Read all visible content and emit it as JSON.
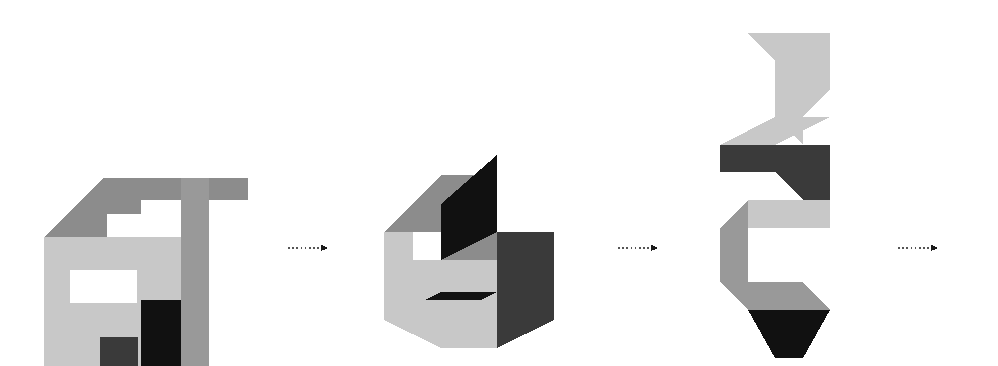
{
  "page": {
    "title": "Voxel Shape Rotation Sequence",
    "background_color": "#ffffff",
    "width": 998,
    "height": 366,
    "figure_count": 3,
    "arrow_count": 3
  },
  "palette": {
    "front_face": "#c8c8c8",
    "top_face": "#8c8c8c",
    "side_face": "#999999",
    "dark_face": "#3a3a3a",
    "shadow_face": "#111111",
    "white_cutout": "#ffffff",
    "arrow_color": "#555555",
    "outline": "#ffffff"
  },
  "figures": [
    {
      "id": "figure-1",
      "label": "Shape A",
      "index": 1,
      "description": "Isometric block cluster with rectangular notch on the front face and a stepped top",
      "bbox": {
        "x": 40,
        "y": 168,
        "width": 266,
        "height": 198
      },
      "faces": [
        {
          "name": "top-left-slab",
          "tone": "top",
          "points": "44,237 103,178 181,178 181,200 141,200 141,214 107,214 107,237"
        },
        {
          "name": "top-right-wing",
          "tone": "top",
          "points": "190,178 248,178 248,200 209,200 209,178"
        },
        {
          "name": "front-main",
          "tone": "front",
          "points": "44,237 181,237 181,366 44,366"
        },
        {
          "name": "front-notch",
          "tone": "cutout",
          "points": "70,270 137,270 137,303 70,303"
        },
        {
          "name": "front-dark-tab",
          "tone": "dark",
          "points": "100,337 138,337 138,366 100,366"
        },
        {
          "name": "shadow-wedge",
          "tone": "shadow",
          "points": "141,300 181,300 181,366 141,366"
        },
        {
          "name": "right-column",
          "tone": "side",
          "points": "181,178 209,178 209,366 181,366"
        },
        {
          "name": "right-pillar",
          "tone": "side",
          "points": "181,200 209,200 209,300 181,300"
        }
      ]
    },
    {
      "id": "figure-2",
      "label": "Shape B",
      "index": 2,
      "description": "Isometric S-shaped block cluster viewed from above-left with dark inner faces",
      "bbox": {
        "x": 384,
        "y": 155,
        "width": 186,
        "height": 200
      },
      "faces": [
        {
          "name": "upper-top",
          "tone": "top",
          "points": "384,232 441,175 497,175 497,204 441,204 441,232"
        },
        {
          "name": "upper-inner",
          "tone": "shadow",
          "points": "441,204 497,155 497,232 441,260"
        },
        {
          "name": "left-front",
          "tone": "front",
          "points": "384,232 413,232 413,300 384,300"
        },
        {
          "name": "mid-top",
          "tone": "top",
          "points": "441,260 497,232 554,232 497,260"
        },
        {
          "name": "mid-front",
          "tone": "front",
          "points": "413,260 497,260 497,300 413,300"
        },
        {
          "name": "right-side",
          "tone": "dark",
          "points": "497,232 554,232 554,320 497,348"
        },
        {
          "name": "lower-inner",
          "tone": "shadow",
          "points": "384,320 441,292 497,292 441,320"
        },
        {
          "name": "lower-front",
          "tone": "front",
          "points": "384,300 497,300 497,348 441,348 384,320"
        }
      ]
    },
    {
      "id": "figure-3",
      "label": "Shape C",
      "index": 3,
      "description": "Tall zig-zag isometric block chain rotated onto its vertical axis",
      "bbox": {
        "x": 700,
        "y": 30,
        "width": 160,
        "height": 330
      },
      "faces": [
        {
          "name": "top-flag",
          "tone": "front",
          "points": "748,33 830,33 830,89 803,116 775,89 775,61"
        },
        {
          "name": "top-flag-tip",
          "tone": "front",
          "points": "775,89 803,116 803,145 775,117"
        },
        {
          "name": "upper-top",
          "tone": "front",
          "points": "720,145 775,117 830,117 775,145"
        },
        {
          "name": "upper-dark",
          "tone": "dark",
          "points": "720,145 775,145 830,145 830,200 803,200 775,172 720,172"
        },
        {
          "name": "mid-light",
          "tone": "front",
          "points": "748,200 830,200 830,228 748,228"
        },
        {
          "name": "mid-left-side",
          "tone": "side",
          "points": "720,228 748,200 748,310 720,282"
        },
        {
          "name": "lower-front",
          "tone": "side",
          "points": "748,282 803,282 830,310 775,310 748,310"
        },
        {
          "name": "lower-shadow",
          "tone": "shadow",
          "points": "748,310 830,310 803,358 775,358"
        }
      ]
    }
  ],
  "arrows": [
    {
      "id": "arrow-1",
      "label": "transition 1 to 2",
      "x1": 288,
      "y1": 248,
      "x2": 328,
      "y2": 248
    },
    {
      "id": "arrow-2",
      "label": "transition 2 to 3",
      "x1": 618,
      "y1": 248,
      "x2": 658,
      "y2": 248
    },
    {
      "id": "arrow-3",
      "label": "transition 3 to answer",
      "x1": 898,
      "y1": 248,
      "x2": 938,
      "y2": 248
    }
  ]
}
